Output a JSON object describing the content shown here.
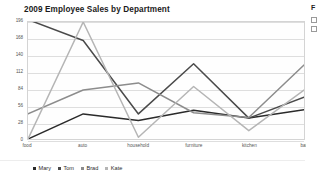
{
  "chart_data": {
    "type": "line",
    "title": "2009 Employee Sales by Department",
    "xlabel": "",
    "ylabel": "",
    "categories": [
      "food",
      "auto",
      "household",
      "furniture",
      "kitchen",
      "bath"
    ],
    "series": [
      {
        "name": "Mary",
        "color": "#2a2a2a",
        "values": [
          0,
          42,
          31,
          48,
          35,
          49
        ]
      },
      {
        "name": "Tom",
        "color": "#4a4a4a",
        "values": [
          200,
          165,
          42,
          126,
          35,
          70
        ]
      },
      {
        "name": "Brad",
        "color": "#8c8c8c",
        "values": [
          42,
          82,
          94,
          44,
          36,
          124
        ]
      },
      {
        "name": "Kate",
        "color": "#b5b5b5",
        "values": [
          0,
          196,
          3,
          88,
          14,
          82
        ]
      }
    ],
    "ylim": [
      0,
      196
    ],
    "yticks": [
      0,
      28,
      56,
      84,
      112,
      140,
      168,
      196
    ],
    "ytick_labels": [
      "0",
      "28",
      "56",
      "84",
      "112",
      "140",
      "168",
      "196"
    ],
    "grid": true,
    "legend_position": "bottom"
  },
  "legend": {
    "items": [
      {
        "label": "Mary",
        "color": "#2a2a2a"
      },
      {
        "label": "Tom",
        "color": "#4a4a4a"
      },
      {
        "label": "Brad",
        "color": "#8c8c8c"
      },
      {
        "label": "Kate",
        "color": "#b5b5b5"
      }
    ]
  },
  "side_panel": {
    "title": "F",
    "rows": [
      "",
      ""
    ]
  }
}
